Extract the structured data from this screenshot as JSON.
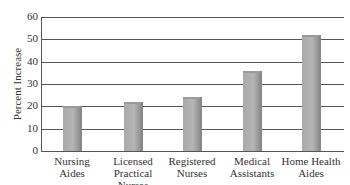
{
  "chart_data": {
    "type": "bar",
    "title": "",
    "xlabel": "",
    "ylabel": "Percent Increase",
    "ylim": [
      0,
      60
    ],
    "yticks": [
      0,
      10,
      20,
      30,
      40,
      50,
      60
    ],
    "grid": true,
    "legend": null,
    "categories": [
      "Nursing Aides",
      "Licensed Practical Nurses",
      "Registered Nurses",
      "Medical Assistants",
      "Home Health Aides"
    ],
    "category_lines": [
      [
        "Nursing",
        "Aides"
      ],
      [
        "Licensed",
        "Practical",
        "Nurses"
      ],
      [
        "Registered",
        "Nurses"
      ],
      [
        "Medical",
        "Assistants"
      ],
      [
        "Home Health",
        "Aides"
      ]
    ],
    "values": [
      20,
      22,
      24,
      36,
      52
    ],
    "bar_color": "#b0b0b0"
  }
}
